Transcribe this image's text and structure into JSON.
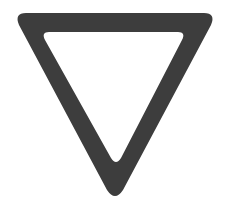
{
  "image": {
    "subject": "yield-sign-outline",
    "shape": "inverted-triangle",
    "colors": {
      "stroke": "#3d3d3d",
      "fill": "#ffffff",
      "background": "#ffffff"
    }
  }
}
